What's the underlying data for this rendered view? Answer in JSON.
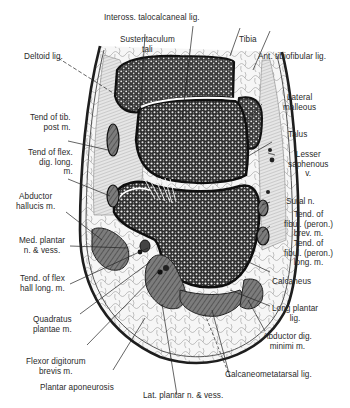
{
  "figure": {
    "labels": {
      "inteross": "Inteross. talocalcaneal lig.",
      "sustentaculum": "Sustentaculum\ntali",
      "tibia": "Tibia",
      "ant_tibiofibular": "Ant. tibiofibular lig.",
      "deltoid": "Deltoid lig.",
      "lateral_malleous": "Lateral\nmalleous",
      "talus": "Talus",
      "tend_tib_post": "Tend of tib.\npost m.",
      "lesser_saphenous": "Lesser\nsaphenous\nv.",
      "tend_flex_dig_long": "Tend of flex.\ndig. long.\nm.",
      "sural": "Sural n.",
      "abductor_hallucis": "Abductor\nhallucis m.",
      "tend_fibul_brev": "Tend. of\nfibul. (peron.)\nbrev. m.",
      "med_plantar": "Med. plantar\nn. & vess.",
      "tend_fibul_long": "Tend. of\nfibul. (peron.)\nlong. m.",
      "tend_flex_hall_long": "Tend. of flex\nhall long. m.",
      "calcaneus": "Calcaneus",
      "quadratus_plantae": "Quadratus\nplantae m.",
      "long_plantar": "Long plantar\nlig.",
      "abductor_dig_minimi": "Abductor dig.\nminimi m.",
      "flexor_dig_brevis": "Flexor digitorum\nbrevis m.",
      "calcaneometatarsal": "Calcaneometatarsal lig.",
      "plantar_aponeurosis": "Plantar aponeurosis",
      "lat_plantar": "Lat. plantar n. & vess."
    },
    "colors": {
      "ink": "#1e1e1e",
      "bone_fill": "#6a6a6a",
      "muscle_fill": "#7a7a7a",
      "fat_fill": "#f4f4f4",
      "background": "#ffffff"
    }
  }
}
